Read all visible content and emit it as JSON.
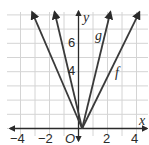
{
  "chart_data": {
    "type": "line",
    "title": "",
    "xlabel": "x",
    "ylabel": "y",
    "origin_label": "O",
    "xlim": [
      -4.8,
      4.6
    ],
    "ylim": [
      -0.7,
      8.3
    ],
    "grid": true,
    "x_ticks": [
      {
        "value": -4,
        "label": "−4"
      },
      {
        "value": -2,
        "label": "−2"
      },
      {
        "value": 2,
        "label": "2"
      },
      {
        "value": 4,
        "label": "4"
      }
    ],
    "y_ticks": [
      {
        "value": 4,
        "label": "4"
      },
      {
        "value": 6,
        "label": "6"
      }
    ],
    "series": [
      {
        "name": "f",
        "label": "f",
        "vertex": [
          0.25,
          0
        ],
        "left_end": [
          -3.2,
          8.2
        ],
        "right_end": [
          4.2,
          8.2
        ],
        "color": "#3a3a3a"
      },
      {
        "name": "g",
        "label": "g",
        "vertex": [
          0.25,
          0
        ],
        "left_end": [
          -1.65,
          8.2
        ],
        "right_end": [
          2.2,
          8.2
        ],
        "color": "#3a3a3a"
      }
    ]
  },
  "labels": {
    "x_axis": "x",
    "y_axis": "y",
    "origin": "O",
    "f": "f",
    "g": "g",
    "xt_m4": "−4",
    "xt_m2": "−2",
    "xt_2": "2",
    "xt_4": "4",
    "yt_4": "4",
    "yt_6": "6"
  }
}
